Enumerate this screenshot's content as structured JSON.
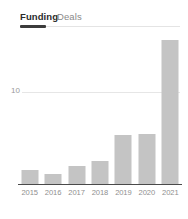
{
  "tabs": [
    {
      "label": "Funding",
      "active": true
    },
    {
      "label": "Deals",
      "active": false
    }
  ],
  "colors": {
    "bar": "#c4c4c4",
    "axis": "#4a4a4a",
    "gridline": "#e6e6e6",
    "tab_active_text": "#2b2b2b",
    "tab_inactive_text": "#8a8a8a",
    "tab_underline": "#3c3c3c",
    "tick_text": "#8f8f8f",
    "background": "#ffffff"
  },
  "chart_data": {
    "type": "bar",
    "title": "",
    "subtitle": "",
    "xlabel": "",
    "ylabel": "",
    "categories": [
      "2015",
      "2016",
      "2017",
      "2018",
      "2019",
      "2020",
      "2021"
    ],
    "values": [
      1.4,
      1.0,
      1.8,
      2.3,
      5.0,
      5.1,
      14.6
    ],
    "series": [
      {
        "name": "Funding",
        "values": [
          1.4,
          1.0,
          1.8,
          2.3,
          5.0,
          5.1,
          14.6
        ]
      }
    ],
    "ylim": [
      0,
      15.6
    ],
    "yticks": [
      10
    ],
    "ytick_labels": [
      "10"
    ],
    "grid": true,
    "legend": false,
    "legend_position": "none",
    "annotations": []
  }
}
